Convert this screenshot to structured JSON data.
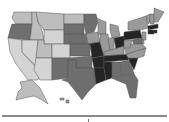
{
  "map": {
    "title": "",
    "type": "choropleth",
    "region": "United States",
    "palette": {
      "lightest": "#d4d4d4",
      "light": "#bdbdbd",
      "mid": "#9a9a9a",
      "dark": "#6e6e6e",
      "darker": "#4a4a4a",
      "darkest": "#252525"
    },
    "states": [
      {
        "id": "WA",
        "shade": "light",
        "d": "M14,12 L32,12 L32,24 L16,24 L12,18 Z"
      },
      {
        "id": "OR",
        "shade": "dark",
        "d": "M12,24 L32,24 L30,40 L8,38 L10,30 Z"
      },
      {
        "id": "CA",
        "shade": "lightest",
        "d": "M8,38 L22,40 L22,52 L40,72 L38,80 L28,80 L16,64 L10,52 Z"
      },
      {
        "id": "ID",
        "shade": "light",
        "d": "M32,12 L36,12 L38,22 L42,30 L44,40 L30,40 L32,24 Z"
      },
      {
        "id": "NV",
        "shade": "lightest",
        "d": "M22,40 L38,40 L36,66 L22,52 Z"
      },
      {
        "id": "MT",
        "shade": "light",
        "d": "M36,12 L64,14 L64,30 L44,30 L38,22 Z"
      },
      {
        "id": "WY",
        "shade": "lightest",
        "d": "M44,30 L64,30 L64,44 L44,44 Z"
      },
      {
        "id": "UT",
        "shade": "light",
        "d": "M38,40 L44,40 L44,44 L52,44 L52,58 L36,58 Z"
      },
      {
        "id": "AZ",
        "shade": "lightest",
        "d": "M36,58 L52,58 L52,80 L40,80 L34,70 Z"
      },
      {
        "id": "CO",
        "shade": "lightest",
        "d": "M52,44 L70,44 L70,58 L52,58 Z"
      },
      {
        "id": "NM",
        "shade": "dark",
        "d": "M52,58 L68,58 L68,78 L52,80 Z"
      },
      {
        "id": "ND",
        "shade": "light",
        "d": "M64,14 L84,14 L84,24 L64,24 Z"
      },
      {
        "id": "SD",
        "shade": "dark",
        "d": "M64,24 L84,24 L84,34 L64,34 Z"
      },
      {
        "id": "NE",
        "shade": "dark",
        "d": "M64,34 L86,34 L88,44 L70,44 L64,44 Z"
      },
      {
        "id": "KS",
        "shade": "dark",
        "d": "M70,44 L90,44 L90,56 L70,56 Z"
      },
      {
        "id": "OK",
        "shade": "dark",
        "d": "M68,58 L92,56 L92,68 L76,68 L76,60 L68,60 Z"
      },
      {
        "id": "TX",
        "shade": "dark",
        "d": "M68,60 L76,60 L76,68 L94,68 L96,84 L88,92 L82,100 L76,92 L68,82 L62,80 L68,78 Z"
      },
      {
        "id": "MN",
        "shade": "dark",
        "d": "M84,14 L96,14 L98,22 L94,32 L86,34 L84,24 Z"
      },
      {
        "id": "IA",
        "shade": "mid",
        "d": "M86,34 L98,32 L100,42 L88,44 Z"
      },
      {
        "id": "MO",
        "shade": "darkest",
        "d": "M88,44 L100,42 L104,56 L92,58 L90,44 Z"
      },
      {
        "id": "AR",
        "shade": "darkest",
        "d": "M92,58 L104,56 L104,68 L94,68 Z"
      },
      {
        "id": "LA",
        "shade": "darkest",
        "d": "M94,68 L104,68 L106,80 L96,84 Z"
      },
      {
        "id": "WI",
        "shade": "mid",
        "d": "M96,18 L106,22 L106,34 L98,34 L98,22 Z"
      },
      {
        "id": "IL",
        "shade": "mid",
        "d": "M100,34 L108,34 L110,50 L104,56 L100,42 Z"
      },
      {
        "id": "MI",
        "shade": "mid",
        "d": "M110,24 L118,26 L120,36 L112,38 L110,30 Z"
      },
      {
        "id": "IN",
        "shade": "mid",
        "d": "M108,38 L114,38 L114,50 L110,50 Z"
      },
      {
        "id": "OH",
        "shade": "darkest",
        "d": "M114,38 L124,36 L126,46 L116,50 Z"
      },
      {
        "id": "KY",
        "shade": "mid",
        "d": "M104,52 L124,46 L124,54 L104,56 Z"
      },
      {
        "id": "TN",
        "shade": "darkest",
        "d": "M104,56 L130,54 L128,60 L104,62 Z"
      },
      {
        "id": "MS",
        "shade": "darkest",
        "d": "M104,62 L112,62 L112,78 L106,80 L104,68 Z"
      },
      {
        "id": "AL",
        "shade": "dark",
        "d": "M112,62 L120,62 L122,76 L112,78 Z"
      },
      {
        "id": "GA",
        "shade": "dark",
        "d": "M120,62 L130,60 L134,74 L122,76 Z"
      },
      {
        "id": "FL",
        "shade": "dark",
        "d": "M112,78 L134,74 L138,80 L136,98 L130,98 L126,84 L116,80 Z"
      },
      {
        "id": "SC",
        "shade": "darkest",
        "d": "M128,58 L138,58 L134,70 L130,62 Z"
      },
      {
        "id": "NC",
        "shade": "mid",
        "d": "M126,54 L146,48 L144,56 L138,58 L128,58 Z"
      },
      {
        "id": "VA",
        "shade": "mid",
        "d": "M124,46 L140,42 L146,48 L126,54 Z"
      },
      {
        "id": "WV",
        "shade": "mid",
        "d": "M124,40 L132,40 L130,48 L124,48 Z"
      },
      {
        "id": "PA",
        "shade": "darkest",
        "d": "M124,32 L140,30 L142,38 L124,40 Z"
      },
      {
        "id": "NY",
        "shade": "mid",
        "d": "M128,22 L146,16 L148,28 L140,30 L128,30 Z"
      },
      {
        "id": "NJ",
        "shade": "mid",
        "d": "M142,32 L146,32 L146,40 L142,40 Z"
      },
      {
        "id": "MD",
        "shade": "dark",
        "d": "M132,40 L142,38 L142,44 L134,44 Z"
      },
      {
        "id": "DE",
        "shade": "mid",
        "d": "M142,40 L144,40 L144,44 L142,44 Z"
      },
      {
        "id": "VT",
        "shade": "mid",
        "d": "M146,16 L150,14 L150,22 L148,24 Z"
      },
      {
        "id": "NH",
        "shade": "mid",
        "d": "M150,14 L154,14 L154,24 L150,24 Z"
      },
      {
        "id": "ME",
        "shade": "mid",
        "d": "M154,8 L164,12 L158,22 L154,22 Z"
      },
      {
        "id": "MA",
        "shade": "darkest",
        "d": "M148,26 L158,24 L158,28 L148,30 Z"
      },
      {
        "id": "CT",
        "shade": "darkest",
        "d": "M148,30 L154,30 L154,34 L148,34 Z"
      },
      {
        "id": "RI",
        "shade": "darkest",
        "d": "M154,30 L157,30 L157,33 L154,33 Z"
      },
      {
        "id": "AK",
        "shade": "light",
        "d": "M20,82 L32,80 L40,88 L44,96 L48,104 L42,100 L34,96 L24,98 L16,100 L18,92 L22,88 Z"
      },
      {
        "id": "HI",
        "shade": "mid",
        "d": "M60,98 L64,98 L64,100 L60,100 Z M66,100 L69,100 L69,103 L66,103 Z"
      }
    ]
  },
  "footer": {
    "divider": true
  }
}
